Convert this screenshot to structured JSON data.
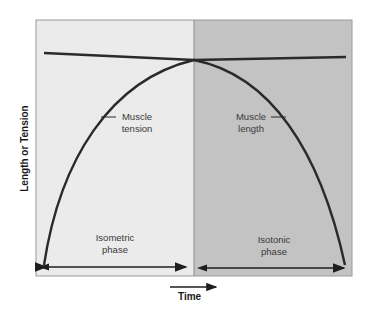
{
  "diagram": {
    "y_axis_label": "Length or Tension",
    "x_axis_label": "Time",
    "panels": [
      {
        "name": "isometric",
        "label_line1": "Isometric",
        "label_line2": "phase",
        "color": "#ebebeb"
      },
      {
        "name": "isotonic",
        "label_line1": "Isotonic",
        "label_line2": "phase",
        "color": "#c2c2c2"
      }
    ],
    "curves": [
      {
        "name": "muscle-tension",
        "label_line1": "Muscle",
        "label_line2": "tension"
      },
      {
        "name": "muscle-length",
        "label_line1": "Muscle",
        "label_line2": "length"
      }
    ],
    "line_color": "#2a2a2a"
  }
}
